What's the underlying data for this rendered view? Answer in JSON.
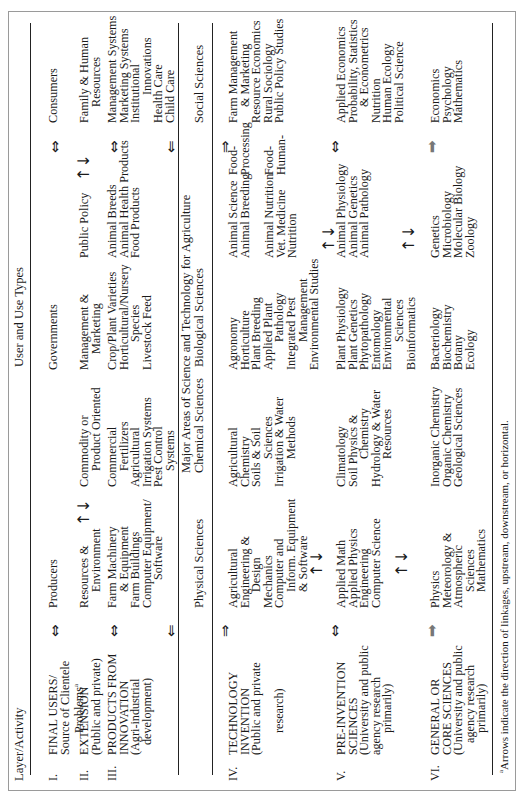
{
  "table": {
    "header": {
      "layer_activity": "Layer/Activity",
      "user_and_use_types": "User and Use Types",
      "major_areas": "Major Areas of Science and Technology for Agriculture"
    },
    "science_columns": {
      "physical": "Physical Sciences",
      "chemical": "Chemical Sciences",
      "biological": "Biological Sciences",
      "social": "Social Sciences"
    },
    "rows": [
      {
        "numeral": "I.",
        "layer": [
          "FINAL USERS/",
          "Source of Clientele",
          "Problems"
        ],
        "footnote_mark": "a",
        "cells": {
          "c1": [
            "Producers"
          ],
          "c3": [
            "Governments"
          ],
          "c5": [
            "Consumers"
          ]
        }
      },
      {
        "numeral": "II.",
        "layer": [
          "EXTENSION",
          "(Public and private)"
        ],
        "cells": {
          "c1": [
            "Resources &",
            "Environment"
          ],
          "c2": [
            "Commodity or",
            "Product Oriented"
          ],
          "c3": [
            "Management &",
            "Marketing"
          ],
          "c4": [
            "Public Policy"
          ],
          "c5": [
            "Family & Human",
            "Resources"
          ]
        }
      },
      {
        "numeral": "III.",
        "layer": [
          "PRODUCTS FROM",
          "INNOVATION",
          "(Agri-industrial",
          "development)"
        ],
        "cells": {
          "c1": [
            "Farm Machinery",
            "& Equipment",
            "Farm Buildings",
            "Computer Equipment/",
            "Software"
          ],
          "c2": [
            "Commercial",
            "Fertilizers",
            "Agricultural",
            "Irrigation Systems",
            "Pest Control",
            "Systems"
          ],
          "c3": [
            "Crop/Plant Varieties",
            "Horticultural/Nursery",
            "Species",
            "Livestock Feed"
          ],
          "c4": [
            "Animal Breeds",
            "Animal Health Products",
            "Food Products"
          ],
          "c5": [
            "Management Systems",
            "Marketing Systems",
            "Institutional",
            "Innovations",
            "Health Care",
            "Child Care"
          ]
        }
      },
      {
        "numeral": "IV.",
        "layer": [
          "TECHNOLOGY",
          "INVENTION",
          "(Public and private",
          "research)"
        ],
        "cells": {
          "c1": [
            "Agricultural",
            "Engineering &",
            "Design",
            "Mechanics",
            "Computer and",
            "Inform. Equipment",
            "& Software"
          ],
          "c2": [
            "Agricultural",
            "Chemistry",
            "Soils & Soil",
            "Sciences",
            "Irrigation & Water",
            "Methods"
          ],
          "c3": [
            "Agronomy",
            "Horticulture",
            "Plant Breeding",
            "Applied Plant",
            "Pathology",
            "Integrated Pest",
            "Management",
            "Environmental Studies"
          ],
          "c4a": [
            "Animal Science",
            "Animal Breeding"
          ],
          "c4b": [
            "Animal Nutrition",
            "Vet. Medicine",
            "Nutrition"
          ],
          "c4c": [
            "Food-",
            "Processing"
          ],
          "c4d": [
            "Food-",
            "Human-"
          ],
          "c5": [
            "Farm Management",
            "& Marketing",
            "Resource Economics",
            "Rural Sociology",
            "Public Policy Studies"
          ]
        }
      },
      {
        "numeral": "V.",
        "layer": [
          "PRE-INVENTION",
          "SCIENCES",
          "(University and public",
          "agency research",
          "primarily)"
        ],
        "cells": {
          "c1": [
            "Applied Math",
            "Applied Physics",
            "Engineering",
            "Computer Science"
          ],
          "c2": [
            "Climatology",
            "Soil Physics &",
            "Chemistry",
            "Hydrology & Water",
            "Resources"
          ],
          "c3": [
            "Plant Physiology",
            "Plant Genetics",
            "Phytopathology",
            "Entomology",
            "Environmental",
            "Sciences",
            "Bioinformatics"
          ],
          "c4": [
            "Animal Physiology",
            "Animal  Genetics",
            "Animal Pathology"
          ],
          "c5": [
            "Applied Economics",
            "Probability, Statistics",
            "& Econometrics",
            "Nutrition",
            "Human Ecology",
            "Political Science"
          ]
        }
      },
      {
        "numeral": "VI.",
        "layer": [
          "GENERAL OR",
          "CORE SCIENCES",
          "(University and public",
          "agency research",
          "primarily)"
        ],
        "cells": {
          "c1": [
            "Physics",
            "Meteorology &",
            "Atmospheric",
            "Sciences",
            "Mathematics"
          ],
          "c2": [
            "Inorganic Chemistry",
            "Organic Chemistry",
            "Geological Sciences"
          ],
          "c3": [
            "Bacteriology",
            "Biochemistry",
            "Botany",
            "Ecology"
          ],
          "c4": [
            "Genetics",
            "Microbiology",
            "Molecular Biology",
            "Zoology"
          ],
          "c5": [
            "Economics",
            "Psychology",
            "Mathematics"
          ]
        }
      }
    ],
    "arrows": {
      "bidirectional_horizontal": "⇔",
      "up_down": "↑↓",
      "left_double": "⇐",
      "right_double": "⇒",
      "right_gray": "➡"
    },
    "footnote": "Arrows indicate the direction of linkages, upstream, downstream, or horizontal.",
    "footnote_mark": "a"
  }
}
